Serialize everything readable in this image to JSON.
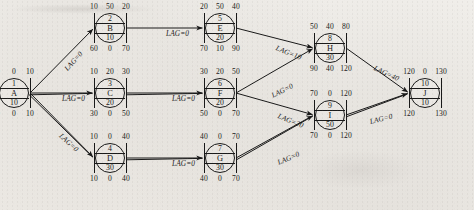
{
  "figure": {
    "type": "project-network-precedence-diagram",
    "notation": {
      "top_row": [
        "early_start",
        "free_float",
        "early_finish"
      ],
      "middle_rows": [
        "activity_number",
        "activity_name",
        "duration"
      ],
      "bottom_row": [
        "late_start",
        "total_float",
        "late_finish"
      ]
    }
  },
  "nodes": [
    {
      "id": "A",
      "key": "node-a",
      "number": "1",
      "name": "A",
      "duration": "10",
      "top": [
        "0",
        "0",
        "10"
      ],
      "bottom": [
        "0",
        "0",
        "10"
      ],
      "x": 14,
      "y": 93
    },
    {
      "id": "B",
      "key": "node-b",
      "number": "2",
      "name": "B",
      "duration": "10",
      "top": [
        "10",
        "50",
        "20"
      ],
      "bottom": [
        "60",
        "0",
        "70"
      ],
      "x": 110,
      "y": 28
    },
    {
      "id": "C",
      "key": "node-c",
      "number": "3",
      "name": "C",
      "duration": "20",
      "top": [
        "10",
        "20",
        "30"
      ],
      "bottom": [
        "30",
        "0",
        "50"
      ],
      "x": 110,
      "y": 93
    },
    {
      "id": "D",
      "key": "node-d",
      "number": "4",
      "name": "D",
      "duration": "30",
      "top": [
        "10",
        "0",
        "40"
      ],
      "bottom": [
        "10",
        "0",
        "40"
      ],
      "x": 110,
      "y": 158
    },
    {
      "id": "E",
      "key": "node-e",
      "number": "5",
      "name": "E",
      "duration": "20",
      "top": [
        "20",
        "50",
        "40"
      ],
      "bottom": [
        "70",
        "10",
        "90"
      ],
      "x": 220,
      "y": 28
    },
    {
      "id": "F",
      "key": "node-f",
      "number": "6",
      "name": "F",
      "duration": "20",
      "top": [
        "30",
        "20",
        "50"
      ],
      "bottom": [
        "50",
        "0",
        "70"
      ],
      "x": 220,
      "y": 93
    },
    {
      "id": "G",
      "key": "node-g",
      "number": "7",
      "name": "G",
      "duration": "30",
      "top": [
        "40",
        "0",
        "70"
      ],
      "bottom": [
        "40",
        "0",
        "70"
      ],
      "x": 220,
      "y": 158
    },
    {
      "id": "H",
      "key": "node-h",
      "number": "8",
      "name": "H",
      "duration": "30",
      "top": [
        "50",
        "40",
        "80"
      ],
      "bottom": [
        "90",
        "40",
        "120"
      ],
      "x": 330,
      "y": 48
    },
    {
      "id": "I",
      "key": "node-i",
      "number": "9",
      "name": "I",
      "duration": "50",
      "top": [
        "70",
        "0",
        "120"
      ],
      "bottom": [
        "70",
        "0",
        "120"
      ],
      "x": 330,
      "y": 115
    },
    {
      "id": "J",
      "key": "node-j",
      "number": "10",
      "name": "J",
      "duration": "10",
      "top": [
        "120",
        "0",
        "130"
      ],
      "bottom": [
        "120",
        "",
        "130"
      ],
      "x": 425,
      "y": 93
    }
  ],
  "edges": [
    {
      "key": "edge-a-b",
      "from": "A",
      "to": "B",
      "label": "LAG=0",
      "lx": 66,
      "ly": 66,
      "rot": -48
    },
    {
      "key": "edge-a-c",
      "from": "A",
      "to": "C",
      "label": "LAG=0",
      "lx": 62,
      "ly": 95,
      "rot": 0
    },
    {
      "key": "edge-a-d",
      "from": "A",
      "to": "D",
      "label": "LAG=0",
      "lx": 60,
      "ly": 131,
      "rot": 42
    },
    {
      "key": "edge-b-e",
      "from": "B",
      "to": "E",
      "label": "LAG=0",
      "lx": 166,
      "ly": 30,
      "rot": 0
    },
    {
      "key": "edge-c-f",
      "from": "C",
      "to": "F",
      "label": "LAG=0",
      "lx": 172,
      "ly": 95,
      "rot": 0
    },
    {
      "key": "edge-d-g",
      "from": "D",
      "to": "G",
      "label": "LAG=0",
      "lx": 172,
      "ly": 160,
      "rot": 0
    },
    {
      "key": "edge-e-h",
      "from": "E",
      "to": "H",
      "label": "LAG=10",
      "lx": 276,
      "ly": 44,
      "rot": 22
    },
    {
      "key": "edge-f-h",
      "from": "F",
      "to": "H",
      "label": "LAG=0",
      "lx": 272,
      "ly": 92,
      "rot": -26
    },
    {
      "key": "edge-f-i",
      "from": "F",
      "to": "I",
      "label": "LAG=20",
      "lx": 278,
      "ly": 112,
      "rot": 22
    },
    {
      "key": "edge-g-i",
      "from": "G",
      "to": "I",
      "label": "LAG=0",
      "lx": 278,
      "ly": 159,
      "rot": -23
    },
    {
      "key": "edge-h-j",
      "from": "H",
      "to": "J",
      "label": "LAG=40",
      "lx": 374,
      "ly": 64,
      "rot": 25
    },
    {
      "key": "edge-i-j",
      "from": "I",
      "to": "J",
      "label": "LAG=0",
      "lx": 370,
      "ly": 118,
      "rot": -14
    }
  ]
}
